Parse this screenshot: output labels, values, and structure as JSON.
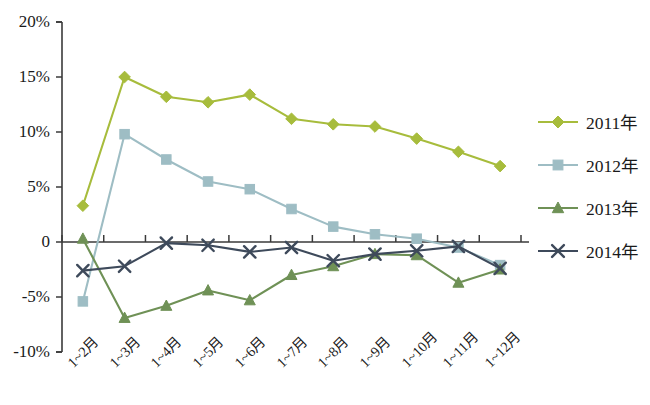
{
  "chart_data": {
    "type": "line",
    "title": "",
    "xlabel": "",
    "ylabel": "",
    "ylim": [
      -10,
      20
    ],
    "ytick_labels": [
      "20%",
      "15%",
      "10%",
      "5%",
      "0",
      "-5%",
      "-10%"
    ],
    "ytick_values": [
      20,
      15,
      10,
      5,
      0,
      -5,
      -10
    ],
    "grid": false,
    "legend_position": "right",
    "categories": [
      "1~2月",
      "1~3月",
      "1~4月",
      "1~5月",
      "1~6月",
      "1~7月",
      "1~8月",
      "1~9月",
      "1~10月",
      "1~11月",
      "1~12月"
    ],
    "series": [
      {
        "name": "2011年",
        "marker": "diamond",
        "color": "#A7BC3C",
        "values": [
          3.3,
          15.0,
          13.2,
          12.7,
          13.4,
          11.2,
          10.7,
          10.5,
          9.4,
          8.2,
          6.9
        ]
      },
      {
        "name": "2012年",
        "marker": "square",
        "color": "#9EBDC4",
        "values": [
          -5.4,
          9.8,
          7.5,
          5.5,
          4.8,
          3.0,
          1.4,
          0.7,
          0.3,
          -0.5,
          -2.1
        ]
      },
      {
        "name": "2013年",
        "marker": "triangle",
        "color": "#6F9156",
        "values": [
          0.3,
          -6.9,
          -5.8,
          -4.4,
          -5.3,
          -3.0,
          -2.2,
          -1.1,
          -1.2,
          -3.7,
          -2.5
        ]
      },
      {
        "name": "2014年",
        "marker": "cross",
        "color": "#3E4A5B",
        "values": [
          -2.6,
          -2.2,
          -0.1,
          -0.3,
          -0.9,
          -0.5,
          -1.7,
          -1.1,
          -0.8,
          -0.4,
          -2.4
        ]
      }
    ]
  },
  "legend": {
    "items": [
      {
        "label": "2011年"
      },
      {
        "label": "2012年"
      },
      {
        "label": "2013年"
      },
      {
        "label": "2014年"
      }
    ]
  }
}
